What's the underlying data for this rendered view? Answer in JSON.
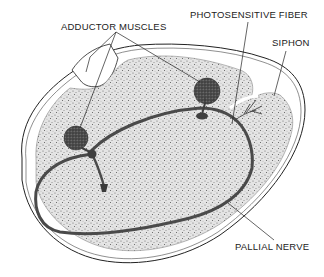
{
  "diagram": {
    "labels": {
      "adductor_muscles": "ADDUCTOR MUSCLES",
      "photosensitive_fiber": "PHOTOSENSITIVE FIBER",
      "siphon": "SIPHON",
      "pallial_nerve": "PALLIAL NERVE"
    },
    "colors": {
      "background": "#ffffff",
      "stipple_body": "#d9d9d9",
      "outline": "#222222",
      "nerve": "#4a4a4a",
      "muscle": "#555555",
      "text": "#222222"
    }
  }
}
